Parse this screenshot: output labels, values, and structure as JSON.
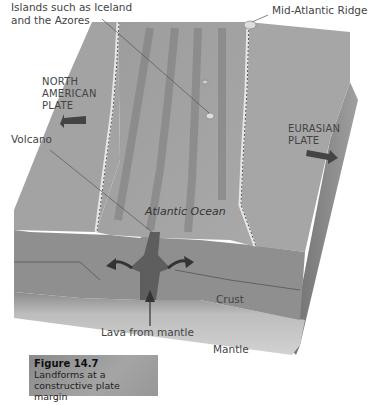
{
  "figure": {
    "number": "Figure 14.7",
    "caption_line1": "Landforms at a",
    "caption_line2": "constructive plate margin"
  },
  "labels": {
    "islands_line1": "Islands such as Iceland",
    "islands_line2": "and the Azores",
    "ridge": "Mid-Atlantic Ridge",
    "north_american_line1": "NORTH",
    "north_american_line2": "AMERICAN",
    "north_american_line3": "PLATE",
    "eurasian_line1": "EURASIAN",
    "eurasian_line2": "PLATE",
    "volcano": "Volcano",
    "ocean": "Atlantic Ocean",
    "crust": "Crust",
    "lava": "Lava from mantle",
    "mantle": "Mantle"
  },
  "colors": {
    "ocean_floor": "#9a9a9a",
    "crust": "#8e8e8e",
    "mantle": "#c9c9c9",
    "magma": "#5e5e5e",
    "arrow": "#444444"
  }
}
